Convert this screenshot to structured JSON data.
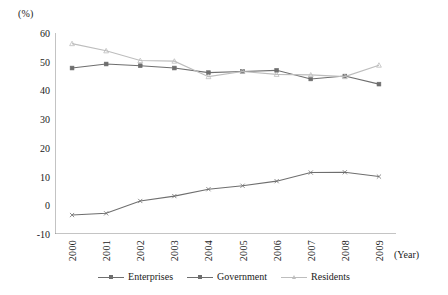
{
  "chart_data": {
    "type": "line",
    "title": "",
    "xlabel": "(Year)",
    "ylabel": "(%)",
    "x": [
      "2000",
      "2001",
      "2002",
      "2003",
      "2004",
      "2005",
      "2006",
      "2007",
      "2008",
      "2009"
    ],
    "categories": [
      "2000",
      "2001",
      "2002",
      "2003",
      "2004",
      "2005",
      "2006",
      "2007",
      "2008",
      "2009"
    ],
    "ylim": [
      -10,
      60
    ],
    "yticks": [
      -10,
      0,
      10,
      20,
      30,
      40,
      50,
      60
    ],
    "ytick_labels": [
      "-10",
      "0",
      "10",
      "20",
      "30",
      "40",
      "50",
      "60"
    ],
    "grid": false,
    "legend_position": "bottom",
    "series": [
      {
        "name": "Enterprises",
        "color": "#6e6e6e",
        "marker": "x",
        "values": [
          -3.4,
          -2.8,
          1.5,
          3.2,
          5.6,
          6.8,
          8.4,
          11.4,
          11.5,
          10.0
        ]
      },
      {
        "name": "Government",
        "color": "#6e6e6e",
        "marker": "square",
        "values": [
          47.8,
          49.2,
          48.6,
          47.8,
          46.2,
          46.6,
          47.0,
          44.0,
          45.0,
          42.2
        ]
      },
      {
        "name": "Residents",
        "color": "#bdbdbd",
        "marker": "triangle",
        "values": [
          56.3,
          53.8,
          50.4,
          50.2,
          44.8,
          46.6,
          45.6,
          45.4,
          44.8,
          48.8
        ]
      }
    ]
  },
  "axis": {
    "unit_label": "(%)",
    "year_label": "(Year)"
  }
}
